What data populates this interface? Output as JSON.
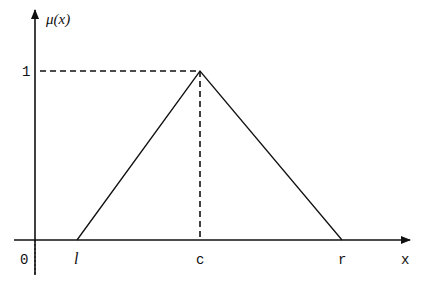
{
  "diagram": {
    "y_axis_label": "μ(x)",
    "x_axis_label": "x",
    "y_tick_one": "1",
    "origin_label": "0",
    "points": {
      "left": "l",
      "center": "c",
      "right": "r"
    },
    "colors": {
      "stroke": "#111111",
      "background": "#ffffff"
    }
  }
}
